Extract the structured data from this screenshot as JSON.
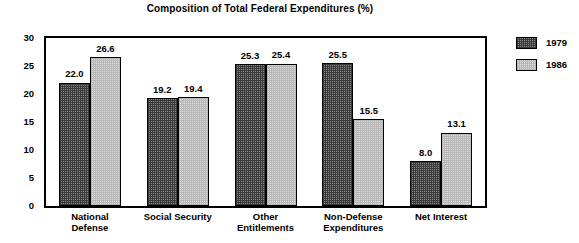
{
  "chart_data": {
    "type": "bar",
    "title": "Composition of Total Federal Expenditures (%)",
    "xlabel": "",
    "ylabel": "",
    "ylim": [
      0,
      30
    ],
    "yticks": [
      0,
      5,
      10,
      15,
      20,
      25,
      30
    ],
    "grid": false,
    "legend_position": "right",
    "categories": [
      "National Defense",
      "Social Security",
      "Other Entitlements",
      "Non-Defense Expenditures",
      "Net Interest"
    ],
    "category_lines": [
      [
        "National",
        "Defense"
      ],
      [
        "Social Security",
        ""
      ],
      [
        "Other",
        "Entitlements"
      ],
      [
        "Non-Defense",
        "Expenditures"
      ],
      [
        "Net Interest",
        ""
      ]
    ],
    "series": [
      {
        "name": "1979",
        "fill": "dark-checker",
        "color": "#6e6e6e",
        "values": [
          22.0,
          19.2,
          25.3,
          25.5,
          8.0
        ],
        "labels": [
          "22.0",
          "19.2",
          "25.3",
          "25.5",
          "8.0"
        ]
      },
      {
        "name": "1986",
        "fill": "light-checker",
        "color": "#d2d2d2",
        "values": [
          26.6,
          19.4,
          25.4,
          15.5,
          13.1
        ],
        "labels": [
          "26.6",
          "19.4",
          "25.4",
          "15.5",
          "13.1"
        ]
      }
    ]
  },
  "axis": {
    "y_tick_labels": [
      "30",
      "25",
      "20",
      "15",
      "10",
      "5",
      "0"
    ]
  },
  "legend": {
    "items": [
      {
        "label": "1979"
      },
      {
        "label": "1986"
      }
    ]
  }
}
